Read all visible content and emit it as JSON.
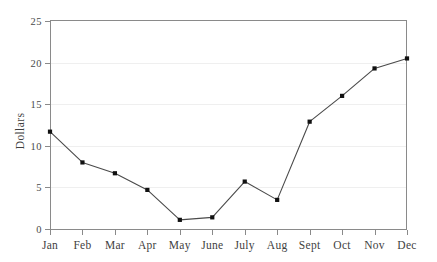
{
  "chart_data": {
    "type": "line",
    "title": "",
    "subtitle": "",
    "xlabel": "",
    "ylabel": "Dollars",
    "categories": [
      "Jan",
      "Feb",
      "Mar",
      "Apr",
      "May",
      "June",
      "July",
      "Aug",
      "Sept",
      "Oct",
      "Nov",
      "Dec"
    ],
    "values": [
      11.7,
      8.0,
      6.7,
      4.7,
      1.1,
      1.4,
      5.7,
      3.5,
      12.9,
      16.0,
      19.3,
      20.5
    ],
    "series": [
      {
        "name": "Dollars",
        "values": [
          11.7,
          8.0,
          6.7,
          4.7,
          1.1,
          1.4,
          5.7,
          3.5,
          12.9,
          16.0,
          19.3,
          20.5
        ]
      }
    ],
    "ylim": [
      0,
      25
    ],
    "yticks": [
      0,
      5,
      10,
      15,
      20,
      25
    ],
    "ytick_labels": [
      "0",
      "5",
      "10",
      "15",
      "20",
      "25"
    ],
    "grid": true,
    "grid_axis": "y",
    "legend": false,
    "legend_position": "none",
    "marker": "square",
    "annotations": []
  },
  "style": {
    "line_color": "#4a4a4a",
    "marker_color": "#111111",
    "grid_color": "#efefef",
    "axis_color": "#8a8a8a",
    "background": "#ffffff",
    "text_color": "#3f3f3f"
  }
}
